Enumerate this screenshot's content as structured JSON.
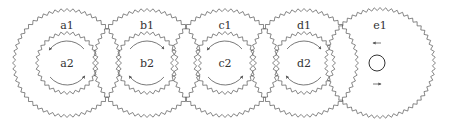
{
  "diagram": {
    "type": "gear-train",
    "stroke_color": "#555555",
    "background": "#ffffff",
    "gears": [
      {
        "id": "a",
        "outer_label": "a1",
        "inner_label": "a2",
        "cx": 67,
        "cy": 63,
        "outer_r": 53,
        "outer_teeth": 56,
        "inner_r": 30,
        "inner_teeth": 32,
        "inner_arrows": "ccw-top-left-bottom-right"
      },
      {
        "id": "b",
        "outer_label": "b1",
        "inner_label": "b2",
        "cx": 147,
        "cy": 63,
        "outer_r": 53,
        "outer_teeth": 56,
        "inner_r": 30,
        "inner_teeth": 32,
        "inner_arrows": "cw-top-right-bottom-left"
      },
      {
        "id": "c",
        "outer_label": "c1",
        "inner_label": "c2",
        "cx": 225,
        "cy": 63,
        "outer_r": 53,
        "outer_teeth": 56,
        "inner_r": 30,
        "inner_teeth": 32,
        "inner_arrows": "ccw-top-left-bottom-right"
      },
      {
        "id": "d",
        "outer_label": "d1",
        "inner_label": "d2",
        "cx": 304,
        "cy": 63,
        "outer_r": 53,
        "outer_teeth": 56,
        "inner_r": 30,
        "inner_teeth": 32,
        "inner_arrows": "cw-top-right-bottom-left"
      },
      {
        "id": "e",
        "outer_label": "e1",
        "inner_label": "",
        "cx": 380,
        "cy": 63,
        "outer_r": 54,
        "outer_teeth": 60,
        "inner_r": 0,
        "inner_teeth": 0,
        "center_circle_r": 8,
        "arrows": [
          "left-top",
          "right-bottom"
        ]
      }
    ]
  }
}
